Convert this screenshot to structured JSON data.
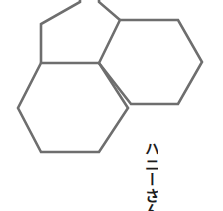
{
  "canvas": {
    "width": 223,
    "height": 211,
    "background_color": "#ffffff"
  },
  "artwork": {
    "name": "honeycomb-hexagon-pattern",
    "stroke_color": "#6e6e6e",
    "stroke_width": 2.6,
    "fill": "none",
    "description": "Outline honeycomb of four hexagons, two cropped by the top edge",
    "hexagons": [
      {
        "id": "hex-top-left-partial",
        "center_x": 51,
        "center_y": 17,
        "radius": 29,
        "clipped": "top"
      },
      {
        "id": "hex-top-center-partial",
        "center_x": 120,
        "center_y": -8,
        "radius": 29,
        "clipped": "top"
      },
      {
        "id": "hex-bottom-left",
        "center_x": 70,
        "center_y": 108,
        "radius": 52,
        "clipped": "none"
      },
      {
        "id": "hex-right",
        "center_x": 149,
        "center_y": 62,
        "radius": 52,
        "clipped": "none"
      }
    ]
  },
  "caption": {
    "text": "ハニーさん",
    "color": "#1c1c1c",
    "orientation": "vertical",
    "clipped": "bottom"
  }
}
